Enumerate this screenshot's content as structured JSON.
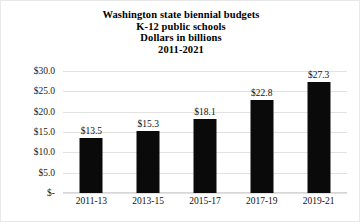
{
  "chart_data": {
    "type": "bar",
    "title": "Washington state biennial budgets K-12 public schools Dollars in billions 2011-2021",
    "title_lines": [
      "Washington state biennial budgets",
      "K-12 public schools",
      "Dollars in billions",
      "2011-2021"
    ],
    "categories": [
      "2011-13",
      "2013-15",
      "2015-17",
      "2017-19",
      "2019-21"
    ],
    "values": [
      13.5,
      15.3,
      18.1,
      22.8,
      27.3
    ],
    "data_labels": [
      "$13.5",
      "$15.3",
      "$18.1",
      "$22.8",
      "$27.3"
    ],
    "xlabel": "",
    "ylabel": "",
    "ylim": [
      0,
      30
    ],
    "ytick_values": [
      30,
      25,
      20,
      15,
      10,
      5,
      0
    ],
    "ytick_labels": [
      "$30.0",
      "$25.0",
      "$20.0",
      "$15.0",
      "$10.0",
      "$5.0",
      "$-"
    ],
    "grid": true,
    "legend": false,
    "bar_color": "#0a0a0a",
    "gridline_color": "#e2e2e2",
    "background_color": "#ffffff",
    "text_color": "#111111"
  }
}
